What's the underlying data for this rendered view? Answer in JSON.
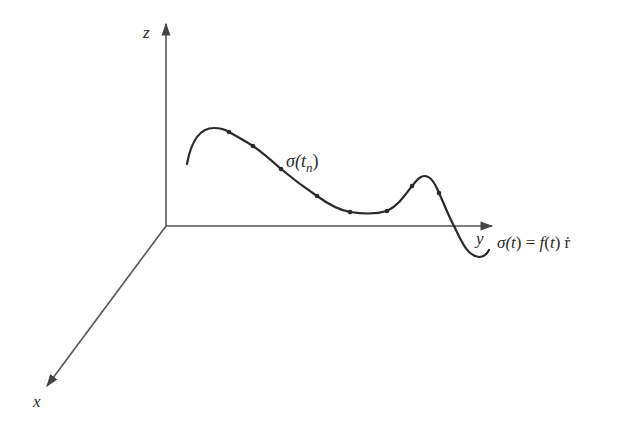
{
  "diagram": {
    "axes": {
      "z_label": "z",
      "y_label": "y",
      "x_label": "x"
    },
    "labels": {
      "point_label": {
        "sigma": "σ(",
        "t": "t",
        "n": "n",
        "close": ")"
      },
      "equation": {
        "sigma": "σ(",
        "t1": "t",
        "mid": ") = ",
        "f": "f",
        "paren_open": "(",
        "t2": "t",
        "paren_close": ")",
        "rdot": " ṙ"
      }
    },
    "colors": {
      "stroke": "#2a2a2a",
      "axis": "#555555",
      "background": "#ffffff"
    },
    "sample_points": [
      [
        229,
        132
      ],
      [
        253,
        146
      ],
      [
        281,
        169
      ],
      [
        317,
        196
      ],
      [
        350,
        212
      ],
      [
        387,
        211
      ],
      [
        412,
        186
      ],
      [
        439,
        193
      ]
    ]
  }
}
